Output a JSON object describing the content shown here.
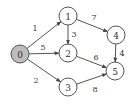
{
  "diagram": {
    "type": "directed-weighted-graph",
    "colors": {
      "source_fill": "#bdbdbd",
      "node_fill": "#ffffff",
      "stroke": "#555555"
    },
    "nodes": [
      {
        "id": "0",
        "label": "0",
        "x": 20,
        "y": 54,
        "highlighted": true
      },
      {
        "id": "1",
        "label": "1",
        "x": 68,
        "y": 16,
        "highlighted": false
      },
      {
        "id": "2",
        "label": "2",
        "x": 68,
        "y": 53,
        "highlighted": false
      },
      {
        "id": "3",
        "label": "3",
        "x": 68,
        "y": 87,
        "highlighted": false
      },
      {
        "id": "4",
        "label": "4",
        "x": 116,
        "y": 35,
        "highlighted": false
      },
      {
        "id": "5",
        "label": "5",
        "x": 115,
        "y": 71,
        "highlighted": false
      }
    ],
    "edges": [
      {
        "from": "0",
        "to": "1",
        "weight": "1",
        "lx": 35,
        "ly": 28
      },
      {
        "from": "0",
        "to": "2",
        "weight": "5",
        "lx": 43,
        "ly": 47
      },
      {
        "from": "0",
        "to": "3",
        "weight": "2",
        "lx": 36,
        "ly": 80
      },
      {
        "from": "1",
        "to": "2",
        "weight": "3",
        "lx": 74,
        "ly": 34
      },
      {
        "from": "1",
        "to": "4",
        "weight": "7",
        "lx": 94,
        "ly": 17
      },
      {
        "from": "2",
        "to": "5",
        "weight": "6",
        "lx": 96,
        "ly": 57
      },
      {
        "from": "4",
        "to": "5",
        "weight": "4",
        "lx": 122,
        "ly": 53
      },
      {
        "from": "3",
        "to": "5",
        "weight": "8",
        "lx": 95,
        "ly": 89
      }
    ]
  }
}
